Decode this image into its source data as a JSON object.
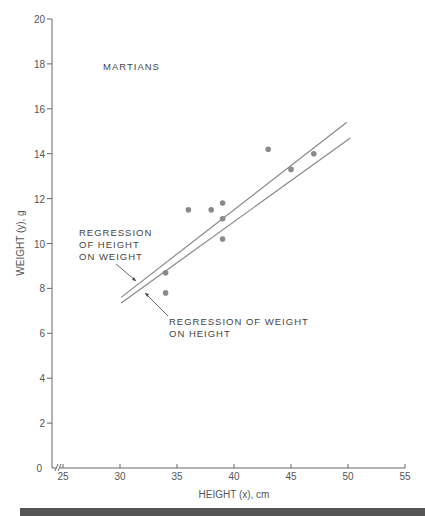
{
  "chart_data": {
    "type": "scatter",
    "title": "MARTIANS",
    "xlabel": "HEIGHT (x), cm",
    "ylabel": "WEIGHT (y), g",
    "xlim": [
      25,
      55
    ],
    "ylim": [
      0,
      20
    ],
    "x_axis_break": true,
    "x_ticks": [
      25,
      30,
      35,
      40,
      45,
      50,
      55
    ],
    "y_ticks": [
      0,
      2,
      4,
      6,
      8,
      10,
      12,
      14,
      16,
      18,
      20
    ],
    "grid": false,
    "series": [
      {
        "name": "Martians",
        "type": "scatter",
        "color": "#8a8a8a",
        "points": [
          {
            "x": 34,
            "y": 7.8
          },
          {
            "x": 34,
            "y": 8.7
          },
          {
            "x": 36,
            "y": 11.5
          },
          {
            "x": 38,
            "y": 11.5
          },
          {
            "x": 39,
            "y": 10.2
          },
          {
            "x": 39,
            "y": 11.1
          },
          {
            "x": 39,
            "y": 11.8
          },
          {
            "x": 43,
            "y": 14.2
          },
          {
            "x": 45,
            "y": 13.3
          },
          {
            "x": 47,
            "y": 14.0
          }
        ]
      },
      {
        "name": "Regression of height on weight",
        "type": "line",
        "color": "#888888",
        "points": [
          {
            "x": 30.1,
            "y": 7.6
          },
          {
            "x": 49.9,
            "y": 15.4
          }
        ]
      },
      {
        "name": "Regression of weight on height",
        "type": "line",
        "color": "#888888",
        "points": [
          {
            "x": 30.1,
            "y": 7.35
          },
          {
            "x": 50.2,
            "y": 14.7
          }
        ]
      }
    ],
    "annotations": [
      {
        "lines": [
          "REGRESSION",
          "OF HEIGHT",
          "ON WEIGHT"
        ],
        "points_to": "Regression of height on weight"
      },
      {
        "lines": [
          "REGRESSION OF WEIGHT",
          "ON  HEIGHT"
        ],
        "points_to": "Regression of weight on height"
      }
    ]
  }
}
